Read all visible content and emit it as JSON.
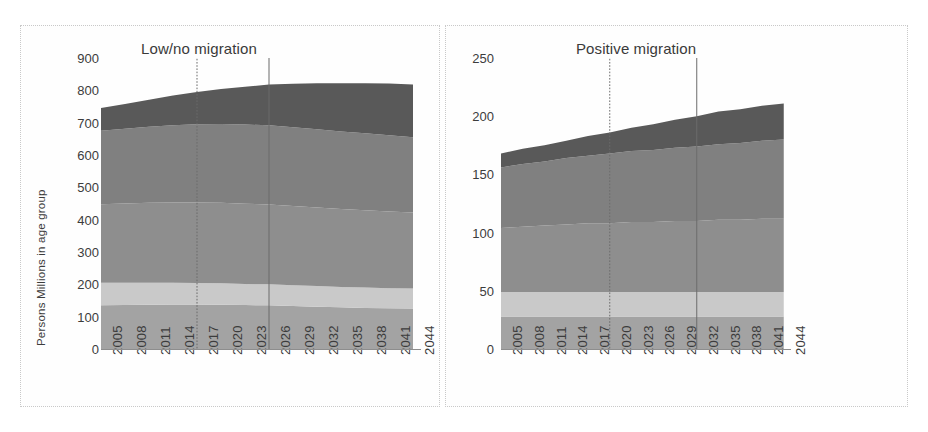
{
  "figure": {
    "background": "#ffffff",
    "panel_border_color": "#c9c9c9"
  },
  "series_style": {
    "0-14 yrs": "#a3a3a3",
    "15-24 yrs": "#c9c9c9",
    "25-44 yrs": "#8e8e8e",
    "45-69 yrs": "#808080",
    "70-plus yrs": "#595959"
  },
  "legend": {
    "position": "right",
    "items": [
      {
        "label": "70-plus yrs",
        "color": "#595959"
      },
      {
        "label": "45-69 yrs",
        "color": "#808080"
      },
      {
        "label": "25-44 yrs",
        "color": "#8e8e8e"
      },
      {
        "label": "15-24 yrs",
        "color": "#c9c9c9"
      },
      {
        "label": "0-14 yrs",
        "color": "#a3a3a3"
      }
    ]
  },
  "chart_data": [
    {
      "id": "low-no-migration",
      "type": "area",
      "stacked": true,
      "title": "Low/no migration",
      "xlabel": "",
      "ylabel": "Persons Millions in age group",
      "ylim": [
        0,
        900
      ],
      "yticks": [
        0,
        100,
        200,
        300,
        400,
        500,
        600,
        700,
        800,
        900
      ],
      "grid": false,
      "xlim": [
        2005,
        2045
      ],
      "tick_labels": [
        "2005",
        "2008",
        "2011",
        "2014",
        "2017",
        "2020",
        "2023",
        "2026",
        "2029",
        "2032",
        "2035",
        "2038",
        "2041",
        "2044"
      ],
      "x": [
        2005,
        2008,
        2011,
        2014,
        2017,
        2020,
        2023,
        2026,
        2029,
        2032,
        2035,
        2038,
        2041,
        2044
      ],
      "markers": [
        {
          "year": 2017,
          "style": "dotted"
        },
        {
          "year": 2026,
          "style": "solid"
        }
      ],
      "series": [
        {
          "name": "0-14 yrs",
          "values": [
            135,
            136,
            137,
            138,
            138,
            137,
            136,
            135,
            133,
            131,
            129,
            127,
            126,
            125
          ]
        },
        {
          "name": "15-24 yrs",
          "values": [
            70,
            69,
            68,
            67,
            66,
            66,
            65,
            65,
            64,
            64,
            63,
            63,
            62,
            62
          ]
        },
        {
          "name": "25-44 yrs",
          "values": [
            243,
            245,
            247,
            248,
            249,
            249,
            248,
            247,
            245,
            243,
            241,
            239,
            237,
            235
          ]
        },
        {
          "name": "45-69 yrs",
          "values": [
            227,
            231,
            235,
            239,
            242,
            244,
            245,
            245,
            244,
            242,
            240,
            238,
            236,
            233
          ]
        },
        {
          "name": "70-plus yrs",
          "values": [
            70,
            77,
            84,
            92,
            100,
            108,
            117,
            126,
            134,
            142,
            149,
            155,
            160,
            163
          ]
        }
      ],
      "totals": [
        745,
        758,
        771,
        784,
        795,
        804,
        811,
        818,
        820,
        822,
        822,
        822,
        821,
        818
      ]
    },
    {
      "id": "positive-migration",
      "type": "area",
      "stacked": true,
      "title": "Positive migration",
      "xlabel": "",
      "ylabel": "",
      "ylim": [
        0,
        250
      ],
      "yticks": [
        0,
        50,
        100,
        150,
        200,
        250
      ],
      "grid": false,
      "xlim": [
        2005,
        2045
      ],
      "tick_labels": [
        "2005",
        "2008",
        "2011",
        "2014",
        "2017",
        "2020",
        "2023",
        "2026",
        "2029",
        "2032",
        "2035",
        "2038",
        "2041",
        "2044"
      ],
      "x": [
        2005,
        2008,
        2011,
        2014,
        2017,
        2020,
        2023,
        2026,
        2029,
        2032,
        2035,
        2038,
        2041,
        2044
      ],
      "markers": [
        {
          "year": 2020,
          "style": "dotted"
        },
        {
          "year": 2032,
          "style": "solid"
        }
      ],
      "series": [
        {
          "name": "0-14 yrs",
          "values": [
            28,
            28,
            28,
            28,
            28,
            28,
            28,
            28,
            28,
            28,
            28,
            28,
            28,
            28
          ]
        },
        {
          "name": "15-24 yrs",
          "values": [
            21,
            21,
            21,
            21,
            21,
            21,
            21,
            21,
            21,
            21,
            21,
            21,
            21,
            21
          ]
        },
        {
          "name": "25-44 yrs",
          "values": [
            55,
            56,
            57,
            58,
            59,
            59,
            60,
            60,
            61,
            61,
            62,
            62,
            63,
            63
          ]
        },
        {
          "name": "45-69 yrs",
          "values": [
            52,
            54,
            55,
            57,
            58,
            60,
            61,
            62,
            63,
            64,
            65,
            66,
            67,
            68
          ]
        },
        {
          "name": "70-plus yrs",
          "values": [
            12,
            13,
            14,
            15,
            17,
            18,
            20,
            22,
            24,
            26,
            28,
            29,
            30,
            31
          ]
        }
      ],
      "totals": [
        168,
        172,
        175,
        179,
        183,
        186,
        190,
        193,
        197,
        200,
        204,
        206,
        209,
        211
      ]
    }
  ]
}
